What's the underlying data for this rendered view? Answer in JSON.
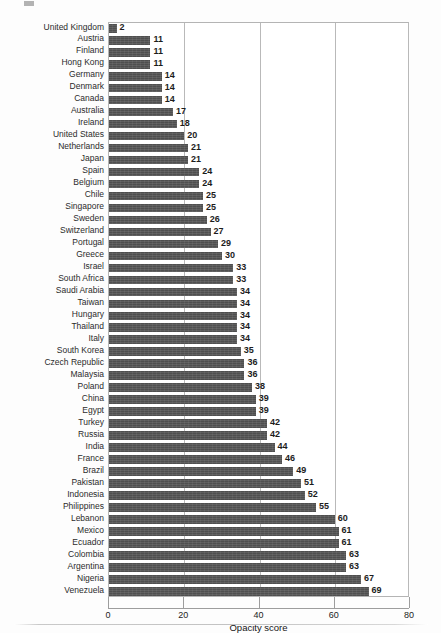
{
  "chart_data": {
    "type": "bar",
    "orientation": "horizontal",
    "title": "",
    "xlabel": "Opacity score",
    "ylabel": "",
    "xlim": [
      0,
      80
    ],
    "xticks": [
      0,
      20,
      40,
      60,
      80
    ],
    "grid": "vertical",
    "legend": "none",
    "bar_color": "#4f4f4f",
    "categories": [
      "United Kingdom",
      "Austria",
      "Finland",
      "Hong Kong",
      "Germany",
      "Denmark",
      "Canada",
      "Australia",
      "Ireland",
      "United States",
      "Netherlands",
      "Japan",
      "Spain",
      "Belgium",
      "Chile",
      "Singapore",
      "Sweden",
      "Switzerland",
      "Portugal",
      "Greece",
      "Israel",
      "South Africa",
      "Saudi Arabia",
      "Taiwan",
      "Hungary",
      "Thailand",
      "Italy",
      "South Korea",
      "Czech Republic",
      "Malaysia",
      "Poland",
      "China",
      "Egypt",
      "Turkey",
      "Russia",
      "India",
      "France",
      "Brazil",
      "Pakistan",
      "Indonesia",
      "Philippines",
      "Lebanon",
      "Mexico",
      "Ecuador",
      "Colombia",
      "Argentina",
      "Nigeria",
      "Venezuela"
    ],
    "values": [
      2,
      11,
      11,
      11,
      14,
      14,
      14,
      17,
      18,
      20,
      21,
      21,
      24,
      24,
      25,
      25,
      26,
      27,
      29,
      30,
      33,
      33,
      34,
      34,
      34,
      34,
      34,
      35,
      36,
      36,
      38,
      39,
      39,
      42,
      42,
      44,
      46,
      49,
      51,
      52,
      55,
      60,
      61,
      61,
      63,
      63,
      67,
      69
    ]
  }
}
